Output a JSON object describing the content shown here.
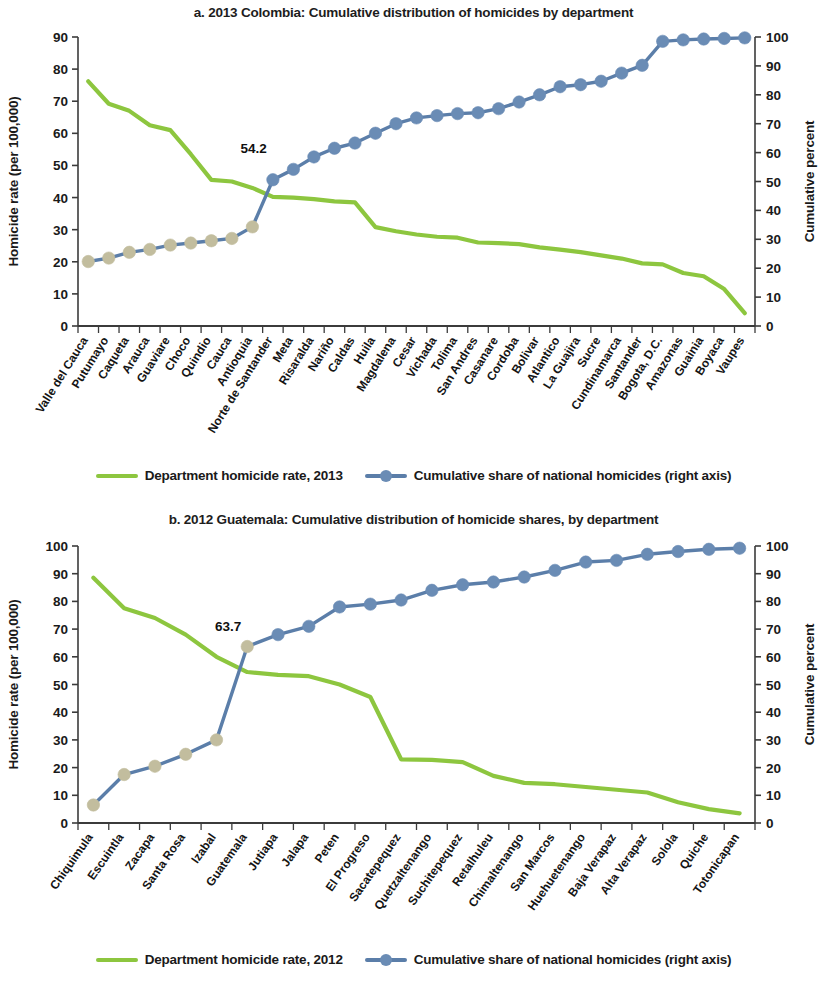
{
  "colors": {
    "rate_line": "#8dc63f",
    "cum_line": "#5b7ea9",
    "marker_blue": "#6a8cb5",
    "marker_tan": "#c2bd9e",
    "axis": "#3b3b3b",
    "text": "#1a1a1a"
  },
  "panel_a": {
    "title": "a. 2013 Colombia: Cumulative distribution of homicides by department",
    "left_axis_title": "Homicide rate (per 100,000)",
    "right_axis_title": "Cumulative percent",
    "legend": {
      "rate_label": "Department homicide rate, 2013",
      "cum_label": "Cumulative share of national homicides (right axis)"
    },
    "annotation": "54.2"
  },
  "panel_b": {
    "title": "b. 2012 Guatemala: Cumulative distribution of homicide shares, by department",
    "left_axis_title": "Homicide rate (per 100,000)",
    "right_axis_title": "Cumulative percent",
    "legend": {
      "rate_label": "Department homicide rate, 2012",
      "cum_label": "Cumulative share of national homicides (right axis)"
    },
    "annotation": "63.7"
  },
  "chart_data": [
    {
      "type": "line",
      "id": "colombia-2013",
      "title": "a. 2013 Colombia: Cumulative distribution of homicides by department",
      "xlabel": "",
      "ylabel": "Homicide rate (per 100,000)",
      "y2label": "Cumulative percent",
      "ylim": [
        0,
        90
      ],
      "yticks": [
        0,
        10,
        20,
        30,
        40,
        50,
        60,
        70,
        80,
        90
      ],
      "y2lim": [
        0,
        100
      ],
      "y2ticks": [
        0,
        10,
        20,
        30,
        40,
        50,
        60,
        70,
        80,
        90,
        100
      ],
      "grid": false,
      "legend_position": "bottom",
      "annotations": [
        {
          "text": "54.2",
          "category": "Norte de Santander",
          "series": "Cumulative share of national homicides (right axis)",
          "value": 54.2
        }
      ],
      "categories": [
        "Valle del Cauca",
        "Putumayo",
        "Caqueta",
        "Arauca",
        "Guaviare",
        "Choco",
        "Quindio",
        "Cauca",
        "Antioquia",
        "Norte de Santander",
        "Meta",
        "Risaralda",
        "Nariño",
        "Caldas",
        "Huila",
        "Magdalena",
        "Cesar",
        "Vichada",
        "Tolima",
        "San Andres",
        "Casanare",
        "Cordoba",
        "Bolivar",
        "Atlantico",
        "La Guajira",
        "Sucre",
        "Cundinamarca",
        "Santander",
        "Bogota, D.C.",
        "Amazonas",
        "Guainia",
        "Boyaca",
        "Vaupes"
      ],
      "series": [
        {
          "name": "Department homicide rate, 2013",
          "axis": "left",
          "color": "#8dc63f",
          "values": [
            76.2,
            69.2,
            67.0,
            62.5,
            61.0,
            53.5,
            45.5,
            45.0,
            43.0,
            40.2,
            40.0,
            39.5,
            38.8,
            38.5,
            30.8,
            29.5,
            28.5,
            27.8,
            27.5,
            26.0,
            25.8,
            25.5,
            24.5,
            23.8,
            23.0,
            22.0,
            21.0,
            19.5,
            19.2,
            16.5,
            15.5,
            11.5,
            4.0
          ]
        },
        {
          "name": "Cumulative share of national homicides (right axis)",
          "axis": "right",
          "color": "#5b7ea9",
          "marker_color_low": "#c2bd9e",
          "marker_color_high": "#6a8cb5",
          "low_count": 9,
          "values": [
            22.3,
            23.5,
            25.5,
            26.5,
            28.0,
            28.7,
            29.5,
            30.3,
            34.3,
            50.6,
            54.2,
            58.5,
            61.5,
            63.3,
            66.7,
            70.0,
            72.0,
            72.8,
            73.5,
            73.8,
            75.2,
            77.5,
            80.0,
            82.8,
            83.5,
            84.7,
            87.5,
            90.2,
            98.5,
            99.0,
            99.3,
            99.5,
            99.7
          ]
        }
      ]
    },
    {
      "type": "line",
      "id": "guatemala-2012",
      "title": "b. 2012 Guatemala: Cumulative distribution of homicide shares, by department",
      "xlabel": "",
      "ylabel": "Homicide rate (per 100,000)",
      "y2label": "Cumulative percent",
      "ylim": [
        0,
        100
      ],
      "yticks": [
        0,
        10,
        20,
        30,
        40,
        50,
        60,
        70,
        80,
        90,
        100
      ],
      "y2lim": [
        0,
        100
      ],
      "y2ticks": [
        0,
        10,
        20,
        30,
        40,
        50,
        60,
        70,
        80,
        90,
        100
      ],
      "grid": false,
      "legend_position": "bottom",
      "annotations": [
        {
          "text": "63.7",
          "category": "Guatemala",
          "series": "Cumulative share of national homicides (right axis)",
          "value": 63.7
        }
      ],
      "categories": [
        "Chiquimula",
        "Escuintla",
        "Zacapa",
        "Santa Rosa",
        "Izabal",
        "Guatemala",
        "Jutiapa",
        "Jalapa",
        "Peten",
        "El Progreso",
        "Sacatepequez",
        "Quetzaltenango",
        "Suchitepequez",
        "Retalhuleu",
        "Chimaltenango",
        "San Marcos",
        "Huehuetenango",
        "Baja Verapaz",
        "Alta Verapaz",
        "Solola",
        "Quiche",
        "Totonicapan"
      ],
      "series": [
        {
          "name": "Department homicide rate, 2012",
          "axis": "left",
          "color": "#8dc63f",
          "values": [
            88.5,
            77.5,
            74.0,
            68.0,
            60.0,
            54.5,
            53.5,
            53.0,
            50.0,
            45.5,
            23.0,
            22.8,
            22.0,
            17.0,
            14.5,
            14.0,
            13.0,
            12.0,
            11.0,
            7.5,
            5.0,
            3.5
          ]
        },
        {
          "name": "Cumulative share of national homicides (right axis)",
          "axis": "right",
          "color": "#5b7ea9",
          "marker_color_low": "#c2bd9e",
          "marker_color_high": "#6a8cb5",
          "low_count": 6,
          "values": [
            6.5,
            17.5,
            20.5,
            24.8,
            30.0,
            63.7,
            68.0,
            71.0,
            78.0,
            79.0,
            80.5,
            84.0,
            86.0,
            87.0,
            88.8,
            91.2,
            94.2,
            94.8,
            97.0,
            98.0,
            98.8,
            99.2
          ]
        }
      ]
    }
  ]
}
